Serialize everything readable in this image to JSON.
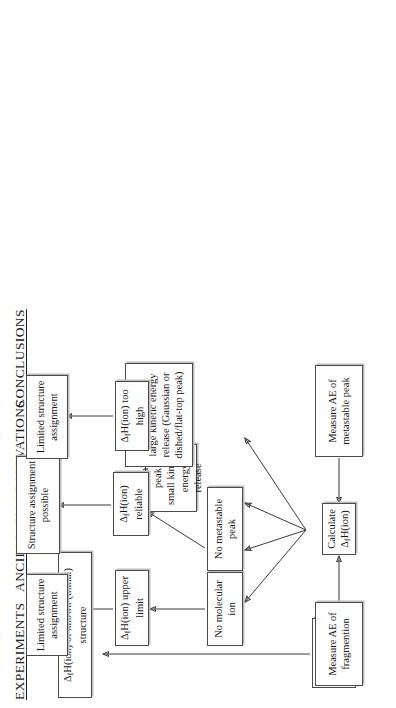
{
  "diagram": {
    "orientation": "rotated-90-ccw",
    "columns": [
      {
        "id": "experiments",
        "label": "EXPERIMENTS"
      },
      {
        "id": "observations",
        "label": "ANCILLIARY OBSERVATIONS"
      },
      {
        "id": "conclusions",
        "label": "CONCLUSIONS"
      }
    ],
    "boxes": [
      {
        "id": "measure-ie",
        "column": "experiments",
        "text": "Measure IE\nof M or M'",
        "html": "Measure IE<br>of M or M'"
      },
      {
        "id": "measure-ae-frag",
        "column": "experiments",
        "text": "Measure AE of\nfragmention",
        "html": "Measure AE of<br>fragmention"
      },
      {
        "id": "calculate-dfh",
        "column": "experiments",
        "text": "Calculate ΔfH(ion)",
        "html": "Calculate Δ<sub>f</sub>H(ion)"
      },
      {
        "id": "measure-ae-metastable",
        "column": "experiments",
        "text": "Measure AE of\nmetastable peak",
        "html": "Measure AE of<br>metastable peak"
      },
      {
        "id": "no-molecular-ion",
        "column": "observations",
        "text": "No molecular ion",
        "html": "No molecular ion"
      },
      {
        "id": "no-metastable-peak",
        "column": "observations",
        "text": "No metastable peak",
        "html": "No metastable peak"
      },
      {
        "id": "metastable-small-ker",
        "column": "observations",
        "text": "Metastable peak\nsmall kinetic\nenergy release",
        "html": "Metastable peak<br>small kinetic<br>energy release"
      },
      {
        "id": "metastable-large-ker",
        "column": "observations",
        "text": "Metastable peak\nlarge kinetic energy\nrelease (Gaussian or\ndished/flat-top peak)",
        "html": "Metastable peak<br>large kinetic energy<br>release (Gaussian or<br>dished/flat-top peak)"
      },
      {
        "id": "dfh-upper-limit",
        "column": "observations",
        "text": "ΔfH(ion) upper limit",
        "html": "Δ<sub>f</sub>H(ion) upper limit"
      },
      {
        "id": "dfh-reliable",
        "column": "observations",
        "text": "ΔfH(ion) reliable",
        "html": "Δ<sub>f</sub>H(ion) reliable"
      },
      {
        "id": "dfh-too-high",
        "column": "observations",
        "text": "ΔfH(ion) too high",
        "html": "Δ<sub>f</sub>H(ion) too high"
      },
      {
        "id": "dfh-known-structure",
        "column": "conclusions",
        "text": "ΔfH(ion) of known (initial) structure",
        "html": "Δ<sub>f</sub>H(ion) of known (initial) structure"
      },
      {
        "id": "limited-structure-assignment-1",
        "column": "conclusions",
        "text": "Limited structure\nassignment",
        "html": "Limited structure<br>assignment"
      },
      {
        "id": "structure-assignment-possible",
        "column": "conclusions",
        "text": "Structure assignment\npossible",
        "html": "Structure assignment<br>possible"
      },
      {
        "id": "limited-structure-assignment-2",
        "column": "conclusions",
        "text": "Limited structure\nassignment",
        "html": "Limited structure<br>assignment"
      }
    ],
    "edges": [
      {
        "from": "measure-ie",
        "to": "dfh-known-structure"
      },
      {
        "from": "measure-ae-frag",
        "to": "calculate-dfh"
      },
      {
        "from": "measure-ae-metastable",
        "to": "calculate-dfh"
      },
      {
        "from": "calculate-dfh",
        "to": "no-molecular-ion"
      },
      {
        "from": "calculate-dfh",
        "to": "no-metastable-peak"
      },
      {
        "from": "calculate-dfh",
        "to": "metastable-small-ker"
      },
      {
        "from": "calculate-dfh",
        "to": "metastable-large-ker"
      },
      {
        "from": "no-molecular-ion",
        "to": "dfh-upper-limit"
      },
      {
        "from": "no-metastable-peak",
        "to": "dfh-reliable"
      },
      {
        "from": "metastable-small-ker",
        "to": "dfh-reliable"
      },
      {
        "from": "metastable-large-ker",
        "to": "dfh-too-high"
      },
      {
        "from": "dfh-upper-limit",
        "to": "limited-structure-assignment-1"
      },
      {
        "from": "dfh-reliable",
        "to": "structure-assignment-possible"
      },
      {
        "from": "dfh-too-high",
        "to": "limited-structure-assignment-2"
      }
    ]
  },
  "colors": {
    "stroke": "#3a3a3a",
    "box_border": "#4a4a4a",
    "text": "#151515",
    "background": "#ffffff",
    "shadow": "#bdbdbd"
  }
}
